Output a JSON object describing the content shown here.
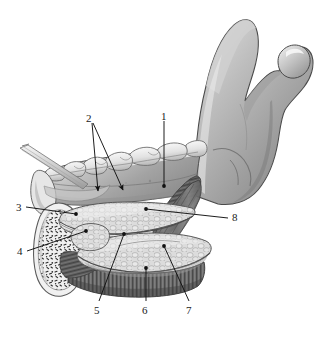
{
  "figure": {
    "background_color": "#ffffff",
    "label_color": "#1a1a1a",
    "leader_color": "#111111",
    "style": "grayscale medical illustration",
    "palette": {
      "bone_light": "#e3e3e3",
      "bone_mid": "#b4b4b4",
      "bone_dark": "#8a8a8a",
      "bone_shadow": "#6d6d6d",
      "gland_light": "#dcdcdc",
      "gland_outline": "#7a7a7a",
      "muscle_dark": "#5c5c5c",
      "muscle_mid": "#767676",
      "tooth_white": "#f2f2f2",
      "tooth_shade": "#c9c9c9",
      "trabecular_dot": "#2e2e2e",
      "probe_light": "#f0f0f0",
      "probe_line": "#8c8c8c"
    }
  },
  "labels": [
    {
      "id": "1",
      "text": "1",
      "x": 161,
      "y": 111,
      "leader": {
        "type": "line",
        "points": [
          [
            164,
            121
          ],
          [
            164,
            186
          ]
        ],
        "dot": true
      }
    },
    {
      "id": "2",
      "text": "2",
      "x": 86,
      "y": 113,
      "leader": {
        "type": "arrow-fork",
        "points": [
          [
            92,
            123
          ],
          [
            99,
            195
          ]
        ],
        "points2": [
          [
            93,
            123
          ],
          [
            125,
            194
          ]
        ],
        "dot": false
      }
    },
    {
      "id": "3",
      "text": "3",
      "x": 16,
      "y": 203,
      "leader": {
        "type": "line",
        "points": [
          [
            26,
            208
          ],
          [
            76,
            214
          ]
        ],
        "dot": true
      }
    },
    {
      "id": "4",
      "text": "4",
      "x": 17,
      "y": 249,
      "leader": {
        "type": "line",
        "points": [
          [
            27,
            251
          ],
          [
            86,
            231
          ]
        ],
        "dot": true
      }
    },
    {
      "id": "5",
      "text": "5",
      "x": 93,
      "y": 307,
      "leader": {
        "type": "line",
        "points": [
          [
            98,
            301
          ],
          [
            124,
            233
          ]
        ],
        "dot": true
      }
    },
    {
      "id": "6",
      "text": "6",
      "x": 142,
      "y": 307,
      "leader": {
        "type": "line",
        "points": [
          [
            146,
            301
          ],
          [
            146,
            267
          ]
        ],
        "dot": true
      }
    },
    {
      "id": "7",
      "text": "7",
      "x": 186,
      "y": 307,
      "leader": {
        "type": "line",
        "points": [
          [
            189,
            301
          ],
          [
            163,
            245
          ]
        ],
        "dot": true
      }
    },
    {
      "id": "8",
      "text": "8",
      "x": 232,
      "y": 215,
      "leader": {
        "type": "line",
        "points": [
          [
            229,
            219
          ],
          [
            145,
            209
          ]
        ],
        "dot": true
      }
    }
  ],
  "structures": [
    {
      "name": "mandibular-ramus"
    },
    {
      "name": "condylar-process"
    },
    {
      "name": "coronoid-process"
    },
    {
      "name": "mandibular-notch"
    },
    {
      "name": "mandibular-body"
    },
    {
      "name": "molar-teeth"
    },
    {
      "name": "sublingual-gland"
    },
    {
      "name": "submandibular-gland"
    },
    {
      "name": "mylohyoid-muscle"
    },
    {
      "name": "hyoid-bone-section"
    },
    {
      "name": "trabecular-bone"
    },
    {
      "name": "probe-instrument"
    }
  ]
}
